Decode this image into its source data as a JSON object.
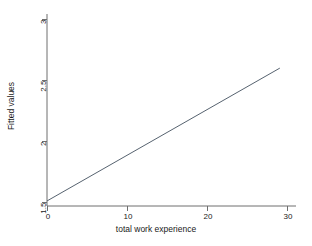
{
  "chart_data": {
    "type": "line",
    "title": "",
    "xlabel": "total work experience",
    "ylabel": "Fitted values",
    "xlim": [
      -0.6,
      30.6
    ],
    "ylim": [
      1.38,
      3.04
    ],
    "xticks": [
      0,
      10,
      20,
      30
    ],
    "xtick_labels": [
      "0",
      "10",
      "20",
      "30"
    ],
    "yticks": [
      1.5,
      2,
      2.5,
      3
    ],
    "ytick_labels": [
      "1.5",
      "2",
      "2.5",
      "3"
    ],
    "grid": false,
    "legend": false,
    "legend_position": "none",
    "series": [
      {
        "name": "Fitted values",
        "color": "#2b3a4a",
        "linewidth": 0.8,
        "x": [
          0,
          29
        ],
        "y": [
          1.515,
          2.6
        ]
      }
    ],
    "annotations": []
  },
  "axes": {
    "x_tick_labels": [
      "0",
      "10",
      "20",
      "30"
    ],
    "y_tick_labels": [
      "1.5",
      "2",
      "2.5",
      "3"
    ],
    "x_title": "total work experience",
    "y_title": "Fitted values"
  },
  "style": {
    "background": "#ffffff",
    "axis_color": "#5a5a5a",
    "text_color": "#1a1a1a",
    "line_color": "#2b3a4a"
  }
}
